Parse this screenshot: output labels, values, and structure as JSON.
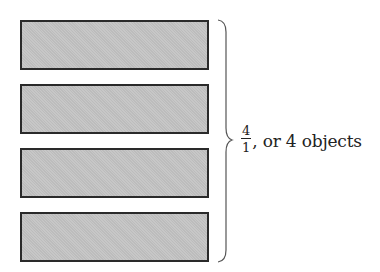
{
  "diagram": {
    "objects": [
      {
        "id": 1,
        "top": 20
      },
      {
        "id": 2,
        "top": 84
      },
      {
        "id": 3,
        "top": 148
      },
      {
        "id": 4,
        "top": 212
      }
    ],
    "object_count": 4,
    "fill_color": "#c4c4c4",
    "border_color": "#2a2a2a",
    "label": {
      "numerator": "4",
      "denominator": "1",
      "text": ", or 4 objects"
    }
  }
}
